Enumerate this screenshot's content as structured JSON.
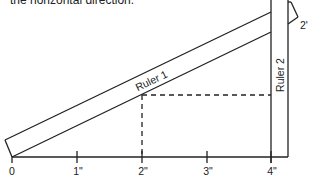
{
  "caption": "the horizontal direction.",
  "rulers": {
    "ruler1_label": "Ruler 1",
    "ruler2_label": "Ruler 2"
  },
  "axis": {
    "ticks": [
      {
        "label": "0",
        "x": 12
      },
      {
        "label": "1\"",
        "x": 77
      },
      {
        "label": "2\"",
        "x": 142
      },
      {
        "label": "3\"",
        "x": 207
      },
      {
        "label": "4\"",
        "x": 271
      }
    ]
  },
  "angle_label": "2'",
  "colors": {
    "stroke": "#222222",
    "background": "#ffffff"
  }
}
